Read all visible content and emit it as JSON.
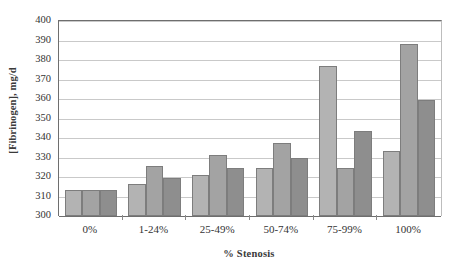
{
  "chart_data": {
    "type": "bar",
    "title": "",
    "subtitle": "",
    "xlabel": "% Stenosis",
    "ylabel": "[Fibrinogen], mg/d",
    "categories": [
      "0%",
      "1-24%",
      "25-49%",
      "50-74%",
      "75-99%",
      "100%"
    ],
    "series": [
      {
        "name": "series-1",
        "color": "#b3b3b3",
        "values": [
          313.5,
          316.5,
          321,
          324.5,
          377,
          333.5
        ]
      },
      {
        "name": "series-2",
        "color": "#a3a3a3",
        "values": [
          313.5,
          325.5,
          331.5,
          337.5,
          324.5,
          388
        ]
      },
      {
        "name": "series-3",
        "color": "#8e8e8e",
        "values": [
          313.5,
          319.5,
          324.5,
          329.5,
          343.5,
          359.5
        ]
      }
    ],
    "ylim": [
      300,
      400
    ],
    "ytick_step": 10,
    "ytick_labels": [
      "400",
      "390",
      "380",
      "370",
      "360",
      "350",
      "340",
      "330",
      "320",
      "310",
      "300"
    ],
    "ytick_values": [
      400,
      390,
      380,
      370,
      360,
      350,
      340,
      330,
      320,
      310,
      300
    ],
    "grid": true,
    "legend": "none",
    "legend_position": "none",
    "annotations": []
  }
}
